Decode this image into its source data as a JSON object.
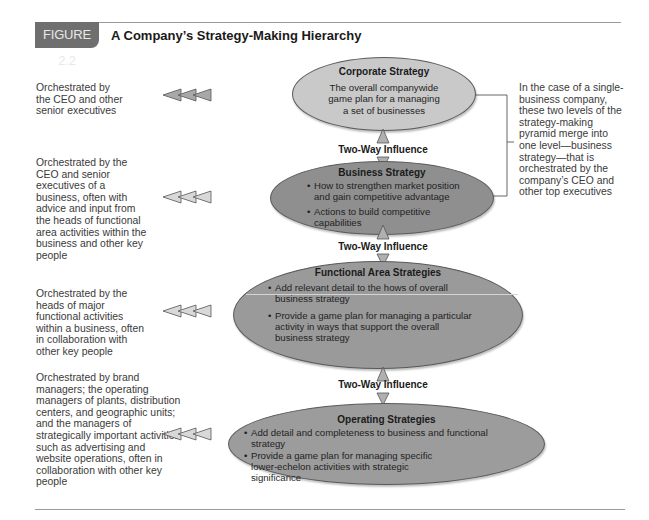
{
  "figure": {
    "label": "FIGURE 2.2",
    "title": "A Company’s Strategy-Making Hierarchy"
  },
  "colors": {
    "label_bg": "#6f6f6f",
    "corporate_fill": "#c9c9c9",
    "business_fill": "#8f8f8f",
    "functional_fill": "#9a9a9a",
    "operating_fill": "#9c9c9c",
    "arrow_fill": "#a8a8a8"
  },
  "levels": [
    {
      "title": "Corporate Strategy",
      "description": "The overall companywide game plan for a managing a set of businesses",
      "orchestrated_by": "Orchestrated by the CEO and other senior executives",
      "arrow_icon": "triple-left-arrow-icon"
    },
    {
      "title": "Business Strategy",
      "bullets": [
        "How to strengthen market position and gain competitive advantage",
        "Actions to build competitive capabilities"
      ],
      "orchestrated_by": "Orchestrated by the CEO and senior executives of a business, often with advice and input from the heads of functional area activities within the business and other key people",
      "arrow_icon": "triple-left-arrow-icon"
    },
    {
      "title": "Functional Area Strategies",
      "bullets": [
        "Add relevant detail to the hows of overall business strategy",
        "Provide a game plan for managing a particular activity in ways that support the overall business strategy"
      ],
      "orchestrated_by": "Orchestrated by the heads of major functional activities within a business, often in collaboration with other key people",
      "arrow_icon": "triple-left-arrow-icon"
    },
    {
      "title": "Operating Strategies",
      "bullets": [
        "Add detail and completeness to business and functional strategy",
        "Provide a game plan for managing specific lower-echelon activities with strategic significance"
      ],
      "orchestrated_by": "Orchestrated by brand managers; the operating managers of plants, distribution centers, and geographic units; and the managers of strategically important activities such as advertising and website operations, often in collaboration with other key people",
      "arrow_icon": "triple-left-arrow-icon"
    }
  ],
  "influence_labels": [
    "Two-Way Influence",
    "Two-Way Influence",
    "Two-Way Influence"
  ],
  "bracket_note": "In the case of a single-business company, these two levels of the strategy-making pyramid merge into one level—business strategy—that is orchestrated by the company’s CEO and other top executives"
}
